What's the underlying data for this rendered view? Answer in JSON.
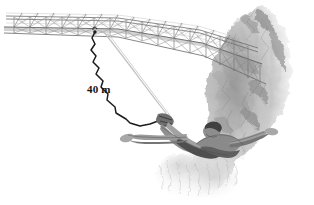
{
  "illustration": {
    "title": "Bungee jumper falling from a truss bridge beside a rocky cliff",
    "style": "pencil-sketch grayscale line drawing",
    "background_color": "#ffffff",
    "canvas": {
      "width": 314,
      "height": 205
    }
  },
  "annotations": {
    "cord_length": {
      "text": "40 m",
      "value": 40,
      "unit": "m",
      "color": "#141414",
      "position": {
        "x": 87,
        "y": 84
      }
    }
  },
  "objects": {
    "bridge": {
      "name": "truss bridge",
      "description": "steel lattice girder bridge with X cross-bracing spanning from left edge into the cliff",
      "color": "#8c8c8c",
      "anchor_point": {
        "x": 95,
        "y": 32
      }
    },
    "cliff": {
      "name": "rock cliff",
      "description": "rugged rock face on the right side of the image",
      "color": "#b0b0b0"
    },
    "bungee_cord": {
      "name": "bungee cord",
      "description": "dark elastic cord zig-zagging from the bridge deck to the jumper's ankles",
      "color": "#1a1a1a",
      "from": {
        "x": 95,
        "y": 32
      },
      "to": {
        "x": 163,
        "y": 120
      }
    },
    "safety_line": {
      "name": "safety line",
      "description": "light secondary rope running parallel to the bungee cord",
      "color": "#bfbfbf",
      "from": {
        "x": 103,
        "y": 31
      },
      "to": {
        "x": 170,
        "y": 121
      }
    },
    "jumper": {
      "name": "bungee jumper",
      "description": "person in a swan dive with arms outstretched, ankles bound to the cord",
      "skin_color": "#9a9a9a",
      "hair_color": "#4a4a4a",
      "head": {
        "x": 205,
        "y": 133
      },
      "left_hand": {
        "x": 128,
        "y": 138
      },
      "right_hand": {
        "x": 262,
        "y": 134
      },
      "ankles": {
        "x": 163,
        "y": 121
      }
    }
  },
  "colors": {
    "ink_dark": "#1a1a1a",
    "ink_mid": "#767676",
    "ink_light": "#b4b4b4",
    "ink_faint": "#d8d8d8",
    "rock_shade": "#a8a8a8",
    "paper": "#ffffff"
  }
}
